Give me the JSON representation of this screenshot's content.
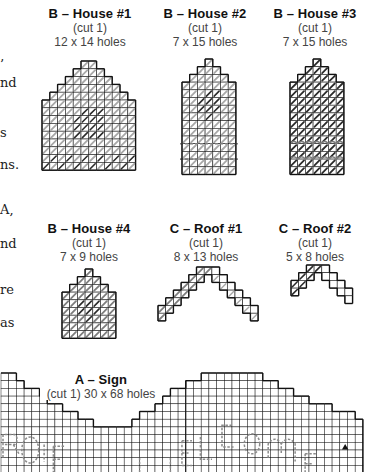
{
  "edge_text": [
    {
      "text": "’",
      "top": 58
    },
    {
      "text": "nd",
      "top": 76
    },
    {
      "text": "s",
      "top": 126
    },
    {
      "text": "ns.",
      "top": 158
    },
    {
      "text": "A,",
      "top": 203
    },
    {
      "text": "nd",
      "top": 237
    },
    {
      "text": "re",
      "top": 283
    },
    {
      "text": "as",
      "top": 316
    }
  ],
  "colors": {
    "grid_line": "#1a1a1a",
    "stitch_light": "#a8a8a8",
    "stitch_mid": "#7d7d7d",
    "stitch_dark": "#2b2b2b",
    "outline": "#111111",
    "letter_dash": "#8a8a8a",
    "marker": "#111111"
  },
  "pieces": [
    {
      "id": "house-1",
      "title": "B – House #1",
      "cut": "(cut 1)",
      "size": "12 x 14 holes",
      "label_x": 30,
      "label_y": 7,
      "x": 41,
      "y": 60,
      "cell": 7.8,
      "rows": [
        [
          5,
          7
        ],
        [
          4,
          8
        ],
        [
          3,
          9
        ],
        [
          2,
          10
        ],
        [
          1,
          11
        ],
        [
          0,
          12
        ],
        [
          0,
          12
        ],
        [
          0,
          12
        ],
        [
          0,
          12
        ],
        [
          0,
          12
        ],
        [
          0,
          12
        ],
        [
          0,
          12
        ],
        [
          0,
          12
        ],
        [
          0,
          12
        ]
      ],
      "fill": "light",
      "dark_cells": [
        [
          6,
          5
        ],
        [
          6,
          6
        ],
        [
          6,
          7
        ],
        [
          7,
          4
        ],
        [
          7,
          5
        ],
        [
          7,
          6
        ],
        [
          7,
          7
        ],
        [
          8,
          4
        ],
        [
          8,
          5
        ],
        [
          8,
          6
        ],
        [
          8,
          7
        ],
        [
          9,
          4
        ],
        [
          9,
          5
        ],
        [
          9,
          6
        ],
        [
          9,
          7
        ],
        [
          12,
          1
        ],
        [
          12,
          3
        ],
        [
          12,
          5
        ],
        [
          12,
          7
        ],
        [
          12,
          9
        ],
        [
          12,
          11
        ],
        [
          13,
          0
        ],
        [
          13,
          2
        ],
        [
          13,
          4
        ],
        [
          13,
          6
        ],
        [
          13,
          8
        ],
        [
          13,
          10
        ]
      ]
    },
    {
      "id": "house-2",
      "title": "B – House #2",
      "cut": "(cut 1)",
      "size": "7 x 15 holes",
      "label_x": 145,
      "label_y": 7,
      "x": 181,
      "y": 58,
      "cell": 7.7,
      "rows": [
        [
          3,
          4
        ],
        [
          2,
          5
        ],
        [
          1,
          6
        ],
        [
          0,
          7
        ],
        [
          0,
          7
        ],
        [
          0,
          7
        ],
        [
          0,
          7
        ],
        [
          0,
          7
        ],
        [
          0,
          7
        ],
        [
          0,
          7
        ],
        [
          0,
          7
        ],
        [
          0,
          7
        ],
        [
          0,
          7
        ],
        [
          0,
          7
        ],
        [
          0,
          7
        ]
      ],
      "fill": "light",
      "dark_cells": [
        [
          4,
          3
        ],
        [
          4,
          4
        ],
        [
          5,
          2
        ],
        [
          5,
          3
        ],
        [
          5,
          4
        ],
        [
          6,
          2
        ],
        [
          6,
          3
        ],
        [
          6,
          4
        ],
        [
          7,
          3
        ]
      ],
      "dash_rows": [
        11,
        13
      ]
    },
    {
      "id": "house-3",
      "title": "B – House #3",
      "cut": "(cut 1)",
      "size": "7 x 15 holes",
      "label_x": 255,
      "label_y": 7,
      "x": 289,
      "y": 58,
      "cell": 7.7,
      "rows": [
        [
          3,
          4
        ],
        [
          2,
          5
        ],
        [
          1,
          6
        ],
        [
          0,
          7
        ],
        [
          0,
          7
        ],
        [
          0,
          7
        ],
        [
          0,
          7
        ],
        [
          0,
          7
        ],
        [
          0,
          7
        ],
        [
          0,
          7
        ],
        [
          0,
          7
        ],
        [
          0,
          7
        ],
        [
          0,
          7
        ],
        [
          0,
          7
        ],
        [
          0,
          7
        ]
      ],
      "fill": "dark",
      "wave_rows": [
        11,
        13
      ]
    },
    {
      "id": "house-4",
      "title": "B – House #4",
      "cut": "(cut 1)",
      "size": "7 x 9 holes",
      "label_x": 29,
      "label_y": 222,
      "x": 61,
      "y": 268,
      "cell": 7.7,
      "rows": [
        [
          3,
          4
        ],
        [
          2,
          5
        ],
        [
          1,
          6
        ],
        [
          0,
          7
        ],
        [
          0,
          7
        ],
        [
          0,
          7
        ],
        [
          0,
          7
        ],
        [
          0,
          7
        ],
        [
          0,
          7
        ]
      ],
      "fill": "mid",
      "dark_cells": [
        [
          3,
          3
        ],
        [
          4,
          2
        ],
        [
          4,
          3
        ],
        [
          4,
          4
        ],
        [
          5,
          2
        ],
        [
          5,
          3
        ],
        [
          5,
          4
        ],
        [
          6,
          3
        ]
      ]
    },
    {
      "id": "roof-1",
      "title": "C – Roof #1",
      "cut": "(cut 1)",
      "size": "8 x 13 holes",
      "label_x": 146,
      "label_y": 222,
      "x": 157,
      "y": 266,
      "cell": 7.7,
      "roof": "full",
      "cols": 13,
      "rows_count": 8,
      "fill": "light_left"
    },
    {
      "id": "roof-2",
      "title": "C – Roof #2",
      "cut": "(cut 1)",
      "size": "5 x 8 holes",
      "label_x": 255,
      "label_y": 222,
      "x": 290,
      "y": 264,
      "cell": 7.7,
      "roof": "half",
      "cols": 8,
      "rows_count": 5,
      "fill": "dark_left"
    }
  ],
  "sign": {
    "title": "A – Sign",
    "size": "(cut 1) 30 x 68 holes",
    "label_x": 38,
    "label_y": 373,
    "x": 0,
    "y": 372,
    "cell": 7.7,
    "cols": 47,
    "top_profile": [
      0,
      0,
      1,
      2,
      2,
      3,
      4,
      4,
      5,
      5,
      6,
      6,
      7,
      7,
      7,
      7,
      7,
      6,
      5,
      5,
      4,
      3,
      2,
      2,
      1,
      1,
      0,
      0,
      0,
      0,
      0,
      0,
      0,
      0,
      1,
      1,
      2,
      2,
      3,
      3,
      4,
      4,
      4,
      5,
      5,
      5,
      6
    ],
    "letters": "ROiE  uEL Come",
    "marker": "triangle-up"
  }
}
